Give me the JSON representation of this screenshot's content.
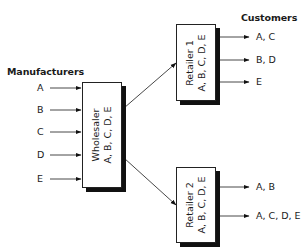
{
  "headings": {
    "manufacturers": "Manufacturers",
    "customers": "Customers"
  },
  "manufacturers": [
    "A",
    "B",
    "C",
    "D",
    "E"
  ],
  "wholesaler": {
    "name": "Wholesaler",
    "products": "A, B, C, D, E"
  },
  "retailers": [
    {
      "name": "Retailer 1",
      "products": "A, B, C, D, E",
      "customers": [
        "A, C",
        "B, D",
        "E"
      ]
    },
    {
      "name": "Retailer 2",
      "products": "A, B, C, D, E",
      "customers": [
        "A, B",
        "A, C, D, E"
      ]
    }
  ]
}
